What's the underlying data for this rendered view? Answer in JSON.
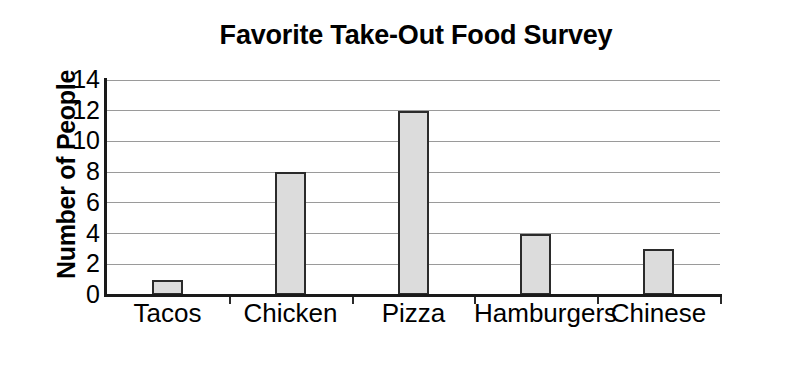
{
  "chart_data": {
    "type": "bar",
    "title": "Favorite Take-Out Food Survey",
    "xlabel": "Food",
    "ylabel": "Number of People",
    "categories": [
      "Tacos",
      "Chicken",
      "Pizza",
      "Hamburgers",
      "Chinese"
    ],
    "values": [
      1,
      8,
      12,
      4,
      3
    ],
    "ylim": [
      0,
      14
    ],
    "ytick_labels": [
      "0",
      "2",
      "4",
      "6",
      "8",
      "10",
      "12",
      "14"
    ],
    "ytick_values": [
      0,
      2,
      4,
      6,
      8,
      10,
      12,
      14
    ],
    "grid": true,
    "legend": null,
    "bar_fill_color": "#dcdcdc",
    "bar_edge_color": "#2b2b2b",
    "gridline_color": "#9a9a9a",
    "axis_color": "#1a1a1a"
  },
  "artifacts": {
    "top_bleed_text": ""
  }
}
